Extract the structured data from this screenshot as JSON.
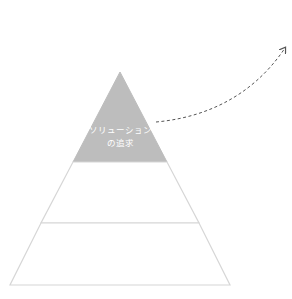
{
  "diagram": {
    "type": "pyramid",
    "tiers": [
      {
        "id": "top",
        "label_lines": [
          "ソリューション",
          "の追求"
        ],
        "fill": "#bdbdbd"
      },
      {
        "id": "middle",
        "label_lines": [],
        "fill": "#ffffff"
      },
      {
        "id": "bottom",
        "label_lines": [],
        "fill": "#ffffff"
      }
    ],
    "outline_color": "#d6d6d6",
    "arrow": {
      "style": "dashed-curve",
      "direction": "up-right",
      "color": "#555555"
    }
  }
}
